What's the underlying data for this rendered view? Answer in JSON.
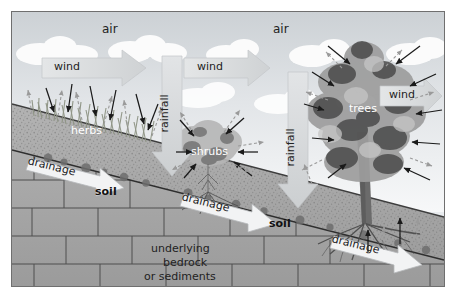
{
  "diagram": {
    "frame": {
      "x": 11,
      "y": 11,
      "width": 432,
      "height": 274,
      "border_color": "#6f6f6f"
    },
    "palette": {
      "sky_top": "#d6dade",
      "sky_bottom": "#f4f6f7",
      "cloud": "#fdfdfd",
      "soil": "#a9a9a9",
      "soil_speckle": "#8a8a8a",
      "bedrock": "#a6a6a6",
      "bedrock_line": "#4a4a4a",
      "flux_arrow": "#d9dbdc",
      "flux_arrow_edge": "#b9bcbe",
      "solid_arrow": "#1a1a1a",
      "dashed_arrow": "#9a9a9a",
      "grass": "#9aa08f",
      "shrub": "#bdbdbd",
      "tree_dark": "#4f4f4f",
      "tree_mid": "#8d8d8d",
      "tree_light": "#bcbcbc",
      "trunk": "#6b6b6b",
      "white_text": "#ffffff",
      "dark_text": "#222222"
    },
    "labels": {
      "air_left": {
        "text": "air",
        "x": 101,
        "y": 22,
        "size": 12,
        "color": "#222222",
        "weight": "normal"
      },
      "air_right": {
        "text": "air",
        "x": 272,
        "y": 22,
        "size": 12,
        "color": "#222222",
        "weight": "normal"
      },
      "wind_left": {
        "text": "wind",
        "x": 53,
        "y": 56,
        "size": 11,
        "color": "#222222"
      },
      "wind_middle": {
        "text": "wind",
        "x": 196,
        "y": 56,
        "size": 11,
        "color": "#222222"
      },
      "wind_right": {
        "text": "wind",
        "x": 388,
        "y": 84,
        "size": 11,
        "color": "#222222"
      },
      "rainfall_left": {
        "text": "rainfall",
        "x": 160,
        "y": 112,
        "size": 11,
        "color": "#222222",
        "rotated": true
      },
      "rainfall_right": {
        "text": "rainfall",
        "x": 286,
        "y": 146,
        "size": 11,
        "color": "#222222",
        "rotated": true
      },
      "herbs": {
        "text": "herbs",
        "x": 70,
        "y": 120,
        "size": 11,
        "color": "#ffffff"
      },
      "shrubs": {
        "text": "shrubs",
        "x": 196,
        "y": 141,
        "size": 11,
        "color": "#ffffff"
      },
      "trees": {
        "text": "trees",
        "x": 348,
        "y": 98,
        "size": 11,
        "color": "#ffffff"
      },
      "drainage_upper": {
        "text": "drainage",
        "x": 24,
        "y": 152,
        "size": 11,
        "color": "#222222"
      },
      "drainage_middle": {
        "text": "drainage",
        "x": 178,
        "y": 188,
        "size": 11,
        "color": "#222222"
      },
      "drainage_lower": {
        "text": "drainage",
        "x": 330,
        "y": 230,
        "size": 11,
        "color": "#222222"
      },
      "soil_left": {
        "text": "soil",
        "x": 94,
        "y": 181,
        "size": 11,
        "color": "#111111",
        "weight": "bold"
      },
      "soil_right": {
        "text": "soil",
        "x": 268,
        "y": 213,
        "size": 11,
        "color": "#111111",
        "weight": "bold"
      },
      "bedrock_line1": {
        "text": "underlying",
        "x": 150,
        "y": 238,
        "size": 11,
        "color": "#222222"
      },
      "bedrock_line2": {
        "text": "bedrock",
        "x": 162,
        "y": 252,
        "size": 11,
        "color": "#222222"
      },
      "bedrock_line3": {
        "text": "or sediments",
        "x": 143,
        "y": 266,
        "size": 11,
        "color": "#222222"
      }
    },
    "legend_semantics": {
      "solid_black_arrow": "precipitation / interception input to vegetation",
      "dashed_gray_arrow": "evaporation / transpiration loss from vegetation",
      "large_gray_arrow_right": "wind flux through the air layer",
      "large_gray_arrow_down": "rainfall flux onto the canopy and ground",
      "white_arrow_downslope": "drainage flow within the soil layer"
    },
    "layers": [
      {
        "name": "air",
        "label": "air"
      },
      {
        "name": "canopy",
        "label": "herbs, shrubs, trees"
      },
      {
        "name": "soil",
        "label": "soil"
      },
      {
        "name": "bedrock",
        "label": "underlying bedrock or sediments"
      }
    ]
  }
}
